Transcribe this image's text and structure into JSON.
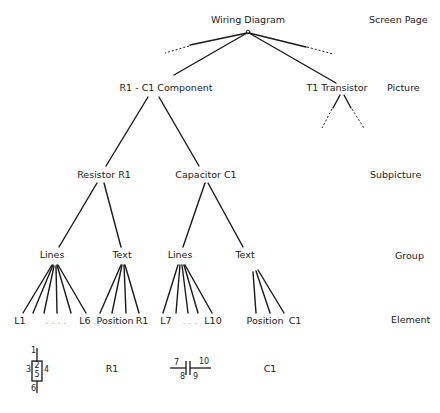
{
  "levels": {
    "screen_page": "Screen Page",
    "picture": "Picture",
    "subpicture": "Subpicture",
    "group": "Group",
    "element": "Element"
  },
  "nodes": {
    "root": "Wiring Diagram",
    "component": "R1 - C1  Component",
    "transistor": "T1  Transistor",
    "resistor": "Resistor  R1",
    "capacitor": "Capacitor  C1",
    "lines_r": "Lines",
    "text_r": "Text",
    "lines_c": "Lines",
    "text_c": "Text"
  },
  "elements": {
    "l1": "L1",
    "dots_r": ". . . .",
    "l6": "L6",
    "position_r": "Position",
    "r1": "R1",
    "l7": "L7",
    "dots_c": ". . .",
    "l10": "L10",
    "position_c": "Position",
    "c1": "C1"
  },
  "symbols": {
    "resistor": {
      "pin_top": "1",
      "pin_left": "3",
      "inner_top": "2",
      "inner_bottom": "5",
      "pin_right": "4",
      "pin_bottom": "6",
      "label": "R1"
    },
    "capacitor": {
      "left_top": "7",
      "right_top": "10",
      "left_bottom": "8",
      "right_bottom": "9",
      "label": "C1"
    }
  }
}
